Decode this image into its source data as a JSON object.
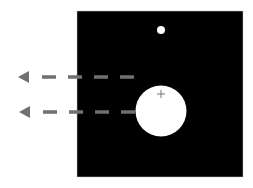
{
  "diagram": {
    "background": "#ffffff",
    "panel": {
      "x": 77,
      "y": 11,
      "width": 166,
      "height": 166,
      "color": "#000000",
      "border": "#cccccc"
    },
    "small_dot": {
      "cx": 161,
      "cy": 30,
      "r": 4,
      "color": "#ffffff"
    },
    "large_circle": {
      "cx": 161,
      "cy": 111,
      "r": 25.5,
      "color": "#ffffff"
    },
    "plus_marker": {
      "cx": 161,
      "cy": 94,
      "size": 4,
      "color": "#777777"
    },
    "arrows": [
      {
        "label": "",
        "y": 77,
        "x_start": 134,
        "x_end": 18,
        "color": "#707070"
      },
      {
        "label": "",
        "y": 112,
        "x_start": 135,
        "x_end": 19,
        "color": "#707070"
      }
    ]
  }
}
